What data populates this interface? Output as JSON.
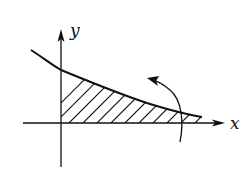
{
  "diagram": {
    "type": "shaded-area-under-curve",
    "axes": {
      "x_label": "x",
      "y_label": "y"
    },
    "curve": "decreasing convex curve crossing y-axis and approaching x-axis",
    "shaded_region": "hatched area under curve between y-axis and right end of curve",
    "annotation": "curved rotation arrow near right end pointing up-left",
    "colors": {
      "stroke": "#111111",
      "background": "#ffffff"
    }
  }
}
